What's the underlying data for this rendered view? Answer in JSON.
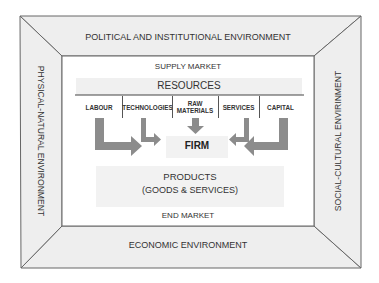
{
  "diagram": {
    "environments": {
      "top": "POLITICAL AND INSTITUTIONAL ENVIRONMENT",
      "bottom": "ECONOMIC ENVIRONMENT",
      "left": "PHYSICAL-NATURAL ENVIRONMENT",
      "right": "SOCIAL-CULTURAL ENVIRINMENT"
    },
    "supply_market": "SUPPLY MARKET",
    "end_market": "END MARKET",
    "resources": {
      "title": "RESOURCES",
      "items": [
        {
          "label": "LABOUR"
        },
        {
          "label": "TECHNOLOGIES"
        },
        {
          "label": "RAW MATERIALS",
          "line1": "RAW",
          "line2": "MATERIALS"
        },
        {
          "label": "SERVICES"
        },
        {
          "label": "CAPITAL"
        }
      ]
    },
    "firm": "FIRM",
    "products": {
      "title": "PRODUCTS",
      "subtitle": "(GOODS & SERVICES)"
    },
    "colors": {
      "panel_fill": "#eeeeee",
      "band_fill": "#f1f1f1",
      "arrow_fill": "#8c8c8c",
      "line": "#555555"
    }
  }
}
